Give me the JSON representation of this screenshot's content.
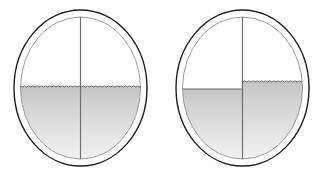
{
  "figure": {
    "type": "diagram",
    "title": "",
    "background_color": "#ffffff",
    "width": 322,
    "height": 175
  },
  "style": {
    "outer_ring_color": "#1c1c1c",
    "outer_ring_width": 1.4,
    "inner_ring_color": "#9a9a9a",
    "inner_ring_width": 1.0,
    "divider_line_color": "#6e6e6e",
    "divider_line_width": 1.2,
    "surface_line_color": "#5a5a5a",
    "surface_line_width": 1.0,
    "fill_top_color": "#c4c4c4",
    "fill_bottom_color": "#f4f4f4"
  },
  "vessels": [
    {
      "id": "vessel-left",
      "label": "Left vessel",
      "outer": {
        "cx": 80.5,
        "cy": 88.0,
        "rx": 66.5,
        "ry": 78.0
      },
      "inner": {
        "cx": 80.5,
        "cy": 88.0,
        "rx": 60.0,
        "ry": 71.0
      },
      "divider": {
        "orientation": "vertical",
        "x": 80.5,
        "y_top": 17.0,
        "y_bottom": 159.0
      },
      "compartments": [
        {
          "id": "left-half",
          "side": "left",
          "fill_level_y": 87.0,
          "surface_style": "wavy",
          "filled": true
        },
        {
          "id": "right-half",
          "side": "right",
          "fill_level_y": 87.0,
          "surface_style": "wavy",
          "filled": true
        }
      ],
      "level_equal": true
    },
    {
      "id": "vessel-right",
      "label": "Right vessel",
      "outer": {
        "cx": 242.5,
        "cy": 88.0,
        "rx": 66.5,
        "ry": 78.0
      },
      "inner": {
        "cx": 242.5,
        "cy": 88.0,
        "rx": 60.0,
        "ry": 71.0
      },
      "divider": {
        "orientation": "vertical",
        "x": 242.5,
        "y_top": 17.0,
        "y_bottom": 159.0
      },
      "compartments": [
        {
          "id": "left-half",
          "side": "left",
          "fill_level_y": 89.0,
          "surface_style": "straight",
          "filled": true
        },
        {
          "id": "right-half",
          "side": "right",
          "fill_level_y": 82.0,
          "surface_style": "wavy",
          "filled": true
        }
      ],
      "level_equal": false
    }
  ]
}
